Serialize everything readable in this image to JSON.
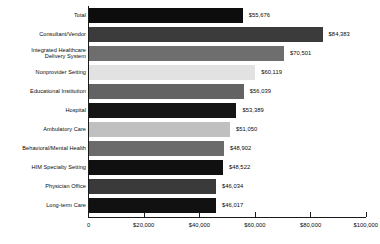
{
  "chart_data": {
    "type": "bar",
    "orientation": "horizontal",
    "title": "",
    "subtitle": "",
    "xlabel": "",
    "ylabel": "",
    "xlim": [
      0,
      100000
    ],
    "grid": false,
    "legend": "none",
    "tick_labels": [
      "0",
      "$20,000",
      "$40,000",
      "$60,000",
      "$80,000",
      "$100,000"
    ],
    "tick_values": [
      0,
      20000,
      40000,
      60000,
      80000,
      100000
    ],
    "categories": [
      "Total",
      "Consultant/Vendor",
      "Integrated Healthcare\nDelivery System",
      "Nonprovider Setting",
      "Educational Institution",
      "Hospital",
      "Ambulatory Care",
      "Behavioral/Mental Health",
      "HIM Specialty Setting",
      "Physician Office",
      "Long-term Care"
    ],
    "values": [
      55676,
      84383,
      70501,
      60119,
      56039,
      53389,
      51050,
      48902,
      48522,
      46034,
      46017
    ],
    "value_labels": [
      "$55,676",
      "$84,383",
      "$70,501",
      "$60,119",
      "$56,039",
      "$53,389",
      "$51,050",
      "$48,902",
      "$48,522",
      "$46,034",
      "$46,017"
    ],
    "bar_colors": [
      "#0d0d0d",
      "#3b3b3b",
      "#6e6e6e",
      "#e2e2e2",
      "#636363",
      "#151515",
      "#c0c0c0",
      "#6b6b6b",
      "#101010",
      "#3a3a3a",
      "#111111"
    ],
    "axis_color": "#1a1a1a"
  }
}
